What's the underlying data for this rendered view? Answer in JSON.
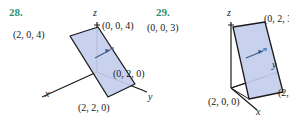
{
  "figures": [
    {
      "number": "28.",
      "plane_fill": "#c3cdeb",
      "plane_stroke": "#1a1a1a",
      "axis_color": "#1a1a1a",
      "normal_color": "#3b5a8c",
      "number_color": "#2f8f6f",
      "axes": [
        {
          "name": "z",
          "label": "z"
        },
        {
          "name": "y",
          "label": "y"
        },
        {
          "name": "x",
          "label": "x"
        }
      ],
      "normal_label": "n",
      "points": [
        {
          "name": "top-right-vertex",
          "label": "(0, 0, 4)"
        },
        {
          "name": "top-left-vertex",
          "label": "(2, 0, 4)"
        },
        {
          "name": "right-vertex",
          "label": "(0, 2, 0)"
        },
        {
          "name": "bottom-vertex",
          "label": "(2, 2, 0)"
        }
      ]
    },
    {
      "number": "29.",
      "plane_fill": "#c3cdeb",
      "plane_stroke": "#1a1a1a",
      "axis_color": "#1a1a1a",
      "normal_color": "#3b5a8c",
      "number_color": "#2f8f6f",
      "axes": [
        {
          "name": "z",
          "label": "z"
        },
        {
          "name": "y",
          "label": "y"
        },
        {
          "name": "x",
          "label": "x"
        }
      ],
      "normal_label": "n",
      "points": [
        {
          "name": "top-left-vertex",
          "label": "(0, 0, 3)"
        },
        {
          "name": "top-right-vertex",
          "label": "(0, 2, 3)"
        },
        {
          "name": "bottom-left-vertex",
          "label": "(2, 0, 0)"
        },
        {
          "name": "bottom-right-vertex",
          "label": "(2,"
        }
      ]
    }
  ]
}
